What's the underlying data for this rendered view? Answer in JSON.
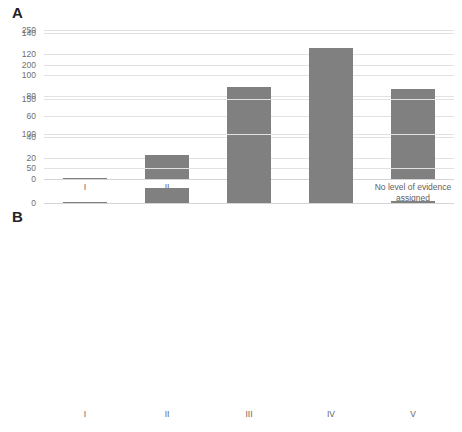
{
  "figure": {
    "background_color": "#ffffff",
    "bar_color": "#808080",
    "gridline_color": "#e2e2e2",
    "tick_label_color": "#6f6f6f"
  },
  "panels": {
    "a": {
      "label": "A"
    },
    "b": {
      "label": "B"
    }
  },
  "chart_data": [
    {
      "id": "A",
      "type": "bar",
      "title": "A",
      "xlabel": "",
      "ylabel": "",
      "categories": [
        "I",
        "II",
        "III",
        "IV",
        "No level of evidence assigned"
      ],
      "values": [
        1,
        23,
        88,
        126,
        86
      ],
      "ylim": [
        0,
        140
      ],
      "yticks": [
        0,
        20,
        40,
        60,
        80,
        100,
        120,
        140
      ],
      "yticklabels": [
        "0",
        "20",
        "40",
        "60",
        "80",
        "100",
        "120",
        "140"
      ],
      "grid": true,
      "legend": null,
      "series": [
        {
          "name": "count",
          "values": [
            1,
            23,
            88,
            126,
            86
          ]
        }
      ]
    },
    {
      "id": "B",
      "type": "bar",
      "title": "B",
      "xlabel": "",
      "ylabel": "",
      "categories": [
        "I",
        "II",
        "III",
        "IV",
        "V"
      ],
      "values": [
        2,
        22,
        90,
        208,
        3
      ],
      "ylim": [
        0,
        250
      ],
      "yticks": [
        0,
        50,
        100,
        150,
        200,
        250
      ],
      "yticklabels": [
        "0",
        "50",
        "100",
        "150",
        "200",
        "250"
      ],
      "grid": true,
      "legend": null,
      "series": [
        {
          "name": "count",
          "values": [
            2,
            22,
            90,
            208,
            3
          ]
        }
      ]
    }
  ]
}
